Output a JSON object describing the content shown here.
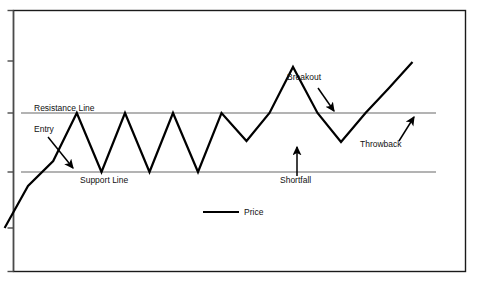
{
  "figure": {
    "title": "",
    "background_color": "#ffffff",
    "border_color": "#1a1a1a",
    "axis_color": "#4a4a4a"
  },
  "labels": {
    "resistance_line": "Resistance Line",
    "support_line": "Support Line",
    "entry": "Entry",
    "breakout": "Breakout",
    "throwback": "Throwback",
    "shortfall": "Shortfall"
  },
  "legend": {
    "position": "inside-bottom-center",
    "entries": [
      {
        "label": "Price",
        "color": "#000000",
        "marker": "line"
      }
    ]
  },
  "chart_data": {
    "type": "line",
    "title": "",
    "xlabel": "",
    "ylabel": "",
    "grid": false,
    "xlim": [
      0,
      100
    ],
    "ylim": [
      0,
      100
    ],
    "axis_ticks": {
      "x": [],
      "y": [
        "",
        "",
        "",
        "",
        ""
      ]
    },
    "series": [
      {
        "name": "Price",
        "color": "#000000",
        "width": 2.2,
        "x": [
          4.6,
          28.0,
          53.2,
          76.8,
          101.5,
          125.0,
          149.5,
          173.0,
          198.0,
          221.5,
          246.5,
          269.5,
          293.0,
          317.5,
          341.0,
          365.5,
          389.0,
          412.5
        ],
        "y": [
          228.0,
          186.0,
          161.0,
          113.0,
          172.0,
          113.0,
          172.0,
          113.0,
          172.0,
          113.0,
          141.0,
          113.0,
          67.0,
          113.0,
          142.0,
          113.0,
          88.0,
          62.0
        ],
        "points": [
          {
            "x": 4.6,
            "y": 228.0
          },
          {
            "x": 53.2,
            "y": 161.0
          },
          {
            "x": 76.8,
            "y": 113.0
          },
          {
            "x": 101.5,
            "y": 172.0
          },
          {
            "x": 125.0,
            "y": 113.0
          },
          {
            "x": 149.5,
            "y": 172.0
          },
          {
            "x": 173.0,
            "y": 113.0
          },
          {
            "x": 198.0,
            "y": 172.0
          },
          {
            "x": 221.5,
            "y": 113.0
          },
          {
            "x": 246.5,
            "y": 141.0
          },
          {
            "x": 293.0,
            "y": 67.0
          },
          {
            "x": 341.0,
            "y": 142.0
          },
          {
            "x": 412.5,
            "y": 62.0
          }
        ]
      }
    ],
    "reference_lines": [
      {
        "name": "Resistance Line",
        "orientation": "horizontal",
        "value": 113.0,
        "color": "#9a9a9a"
      },
      {
        "name": "Support Line",
        "orientation": "horizontal",
        "value": 172.0,
        "color": "#9a9a9a"
      }
    ],
    "annotations": [
      {
        "text": "Resistance Line",
        "x": 33,
        "y": 106,
        "arrow": false
      },
      {
        "text": "Entry",
        "x": 33,
        "y": 128,
        "arrow": true,
        "arrow_to": {
          "x": 73,
          "y": 168
        }
      },
      {
        "text": "Support Line",
        "x": 80,
        "y": 180,
        "arrow": false
      },
      {
        "text": "Breakout",
        "x": 287,
        "y": 77,
        "arrow": true,
        "arrow_to": {
          "x": 334,
          "y": 111
        }
      },
      {
        "text": "Shortfall",
        "x": 281,
        "y": 180,
        "arrow": true,
        "arrow_to": {
          "x": 297,
          "y": 147
        }
      },
      {
        "text": "Throwback",
        "x": 361,
        "y": 144,
        "arrow": true,
        "arrow_to": {
          "x": 414,
          "y": 117
        }
      }
    ]
  }
}
